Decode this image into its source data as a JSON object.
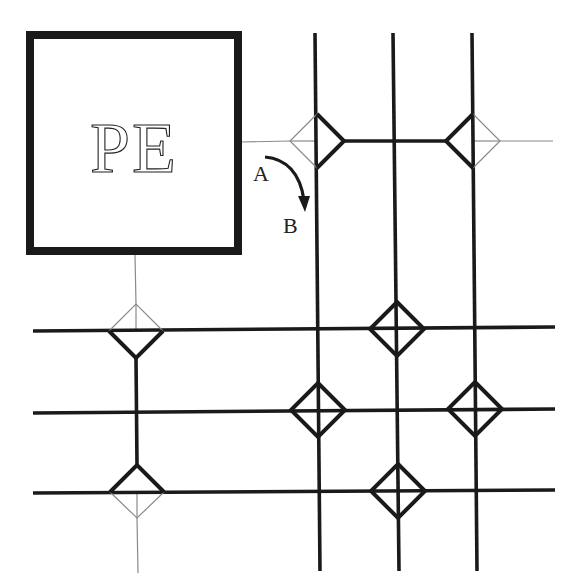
{
  "diagram": {
    "type": "CGRA interconnect with switch boxes",
    "pe_block": {
      "label": "PE",
      "x": 30,
      "y": 35,
      "w": 208,
      "h": 216
    },
    "arrow": {
      "from_label": "A",
      "to_label": "B",
      "meaning": "switch turn from A to B"
    },
    "colors": {
      "ink": "#1a1a1a",
      "thin": "#8a8a8a",
      "background": "#ffffff"
    },
    "vertical_wires": [
      {
        "x1": 315,
        "y1": 33,
        "x2": 320,
        "y2": 571
      },
      {
        "x1": 393,
        "y1": 33,
        "x2": 399,
        "y2": 571
      },
      {
        "x1": 472,
        "y1": 33,
        "x2": 477,
        "y2": 571
      }
    ],
    "horizontal_wires": [
      {
        "x1": 33,
        "y1": 331,
        "x2": 555,
        "y2": 327
      },
      {
        "x1": 33,
        "y1": 413,
        "x2": 555,
        "y2": 409
      },
      {
        "x1": 33,
        "y1": 493,
        "x2": 555,
        "y2": 490
      }
    ],
    "switches": [
      {
        "id": "sw-top-1",
        "cx": 317,
        "cy": 141,
        "thick_edges": [
          "tr",
          "br"
        ],
        "thin_edges": [
          "tl",
          "bl"
        ],
        "cross": false
      },
      {
        "id": "sw-top-2",
        "cx": 473,
        "cy": 141,
        "thick_edges": [
          "tl",
          "bl"
        ],
        "thin_edges": [
          "tr",
          "br"
        ],
        "cross": false
      },
      {
        "id": "sw-left-1",
        "cx": 136,
        "cy": 331,
        "thick_edges": [
          "bl",
          "br"
        ],
        "thin_edges": [
          "tl",
          "tr"
        ],
        "cross": false
      },
      {
        "id": "sw-left-2",
        "cx": 137,
        "cy": 492,
        "thick_edges": [
          "tl",
          "tr"
        ],
        "thin_edges": [
          "bl",
          "br"
        ],
        "cross": false
      },
      {
        "id": "sw-r1-c2",
        "cx": 397,
        "cy": 329,
        "thick_edges": [
          "tl",
          "tr",
          "bl",
          "br"
        ],
        "thin_edges": [],
        "cross": true
      },
      {
        "id": "sw-r2-c1",
        "cx": 318,
        "cy": 410,
        "thick_edges": [
          "tl",
          "tr",
          "bl",
          "br"
        ],
        "thin_edges": [],
        "cross": true
      },
      {
        "id": "sw-r2-c3",
        "cx": 475,
        "cy": 409,
        "thick_edges": [
          "tl",
          "tr",
          "bl",
          "br"
        ],
        "thin_edges": [],
        "cross": true
      },
      {
        "id": "sw-r3-c2",
        "cx": 398,
        "cy": 491,
        "thick_edges": [
          "tl",
          "tr",
          "bl",
          "br"
        ],
        "thin_edges": [],
        "cross": true
      }
    ]
  }
}
